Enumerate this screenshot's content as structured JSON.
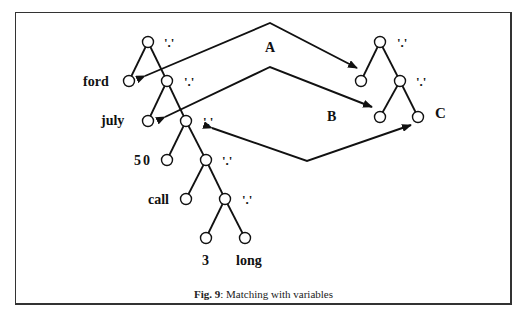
{
  "figure": {
    "caption_prefix": "Fig. 9",
    "caption_text": ": Matching with variables"
  },
  "left_tree": {
    "operator_label": "'.'",
    "leaves": [
      "ford",
      "july",
      "50",
      "call",
      "3",
      "long"
    ]
  },
  "right_tree": {
    "operator_label": "'.'",
    "variable_label": "C"
  },
  "arrows": [
    {
      "label": "A",
      "from": "left-tree leaf ford",
      "to": "right-tree first leaf"
    },
    {
      "label": "B",
      "from": "left-tree leaf july",
      "to": "right-tree second-level left leaf"
    },
    {
      "label": "C",
      "from": "right-tree variable C",
      "to": "left-tree remaining sublist"
    }
  ],
  "labels": {
    "ford": "ford",
    "july": "july",
    "fifty": "50",
    "call": "call",
    "three": "3",
    "long": "long",
    "A": "A",
    "B": "B",
    "C": "C",
    "dot": "'.'"
  }
}
